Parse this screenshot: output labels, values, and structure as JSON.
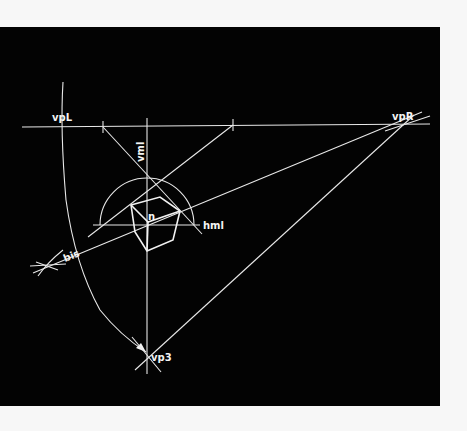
{
  "figure": {
    "type": "perspective-construction-diagram",
    "background_color": "#030303",
    "line_color": "#e8e8e8",
    "page_color": "#f7f7f7"
  },
  "labels": {
    "vpL": "vpL",
    "vpR": "vpR",
    "vp3": "vp3",
    "vml": "vml",
    "hml": "hml",
    "bis": "bis",
    "n": "n"
  },
  "points": {
    "vpL": [
      61,
      127
    ],
    "vpR": [
      402,
      125
    ],
    "vp3": [
      147,
      352
    ],
    "n": [
      148,
      222
    ],
    "tick_left": [
      103,
      126
    ],
    "tick_right": [
      233,
      125
    ]
  },
  "cube": {
    "vertices": {
      "A": [
        131,
        205
      ],
      "B": [
        160,
        197
      ],
      "C": [
        180,
        211
      ],
      "N": [
        148,
        222
      ],
      "D": [
        173,
        240
      ],
      "E": [
        147,
        251
      ],
      "F": [
        135,
        232
      ]
    },
    "edges": [
      [
        "A",
        "B"
      ],
      [
        "B",
        "C"
      ],
      [
        "A",
        "N"
      ],
      [
        "N",
        "C"
      ],
      [
        "A",
        "F"
      ],
      [
        "F",
        "E"
      ],
      [
        "E",
        "D"
      ],
      [
        "D",
        "C"
      ],
      [
        "N",
        "E"
      ]
    ]
  },
  "construction_lines": [
    {
      "name": "horizon-line",
      "from": [
        22,
        127
      ],
      "to": [
        430,
        124
      ]
    },
    {
      "name": "vertical-measuring-line",
      "from": [
        147,
        118
      ],
      "to": [
        147,
        372
      ]
    },
    {
      "name": "horizontal-measuring-line",
      "from": [
        93,
        225
      ],
      "to": [
        200,
        225
      ]
    },
    {
      "name": "vpR-to-vp3",
      "from": [
        414,
        115
      ],
      "to": [
        135,
        370
      ]
    },
    {
      "name": "vpR-to-bis",
      "from": [
        422,
        112
      ],
      "to": [
        33,
        273
      ]
    },
    {
      "name": "tick-left-diagonal",
      "from": [
        103,
        127
      ],
      "to": [
        200,
        232
      ]
    },
    {
      "name": "tick-right-diagonal",
      "from": [
        233,
        125
      ],
      "to": [
        88,
        237
      ]
    },
    {
      "name": "vpR-extension",
      "from": [
        385,
        131
      ],
      "to": [
        430,
        116
      ]
    }
  ],
  "arcs": [
    {
      "name": "large-arc-vpL-to-vp3",
      "path": "M63,82 Q60,130 66,200 Q75,265 100,310 Q120,335 146,352"
    },
    {
      "name": "measuring-semicircle",
      "center": [
        147,
        225
      ],
      "radius": 47
    }
  ]
}
